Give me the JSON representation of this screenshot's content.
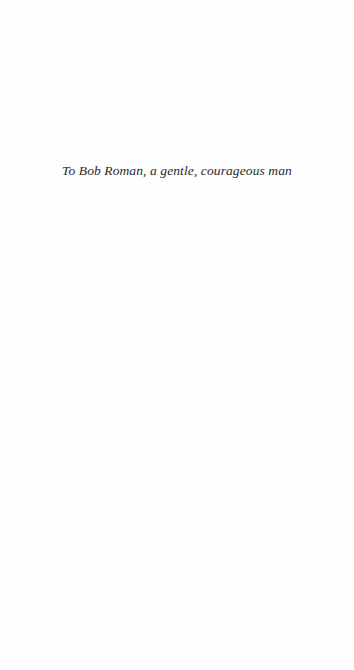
{
  "page": {
    "type": "dedication",
    "dedication_text": "To Bob Roman, a gentle, courageous man"
  }
}
